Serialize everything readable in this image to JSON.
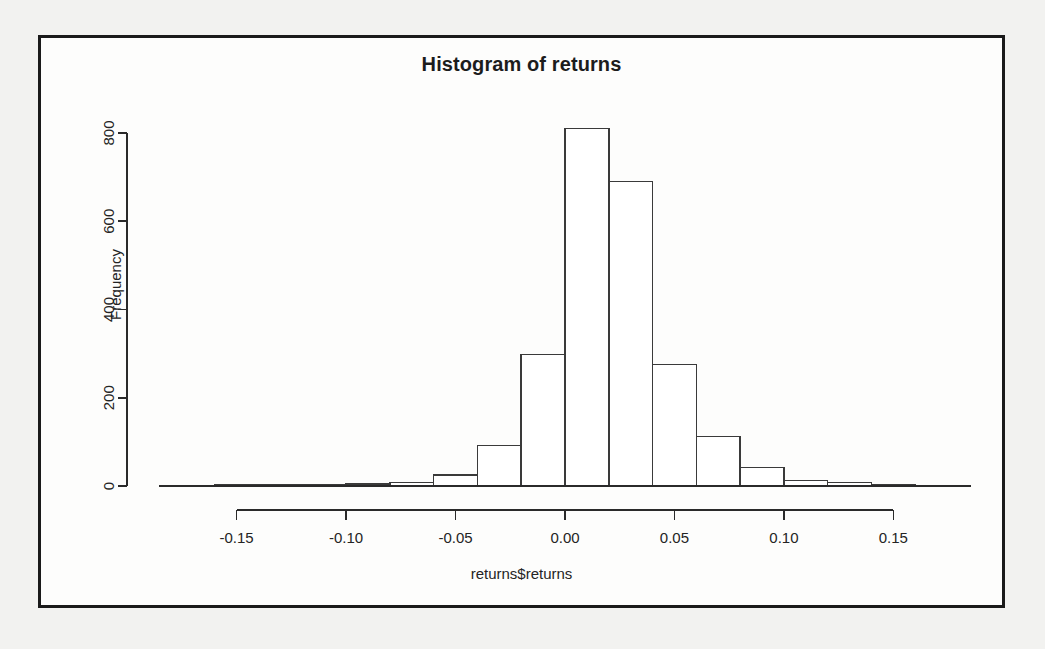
{
  "figure": {
    "background_color": "#f2f2f0",
    "frame_color": "#1a1a1a",
    "plot_background": "#fdfdfc"
  },
  "chart_data": {
    "type": "bar",
    "subtype": "histogram",
    "title": "Histogram of returns",
    "xlabel": "returns$returns",
    "ylabel": "Frequency",
    "grid": false,
    "legend": null,
    "xlim": [
      -0.185,
      0.185
    ],
    "ylim": [
      0,
      800
    ],
    "bin_width": 0.02,
    "xticks": [
      -0.15,
      -0.1,
      -0.05,
      0.0,
      0.05,
      0.1,
      0.15
    ],
    "xticklabels": [
      "-0.15",
      "-0.10",
      "-0.05",
      "0.00",
      "0.05",
      "0.10",
      "0.15"
    ],
    "yticks": [
      0,
      200,
      400,
      600,
      800
    ],
    "yticklabels": [
      "0",
      "200",
      "400",
      "600",
      "800"
    ],
    "bin_edges": [
      -0.18,
      -0.16,
      -0.14,
      -0.12,
      -0.1,
      -0.08,
      -0.06,
      -0.04,
      -0.02,
      0.0,
      0.02,
      0.04,
      0.06,
      0.08,
      0.1,
      0.12,
      0.14,
      0.16,
      0.18
    ],
    "bin_centers": [
      -0.17,
      -0.15,
      -0.13,
      -0.11,
      -0.09,
      -0.07,
      -0.05,
      -0.03,
      -0.01,
      0.01,
      0.03,
      0.05,
      0.07,
      0.09,
      0.11,
      0.13,
      0.15,
      0.17
    ],
    "values": [
      1,
      2,
      2,
      3,
      4,
      8,
      25,
      92,
      298,
      810,
      690,
      275,
      112,
      42,
      12,
      8,
      3,
      1
    ],
    "bar_fill": "#ffffff",
    "bar_edge": "#3a3a3a"
  }
}
